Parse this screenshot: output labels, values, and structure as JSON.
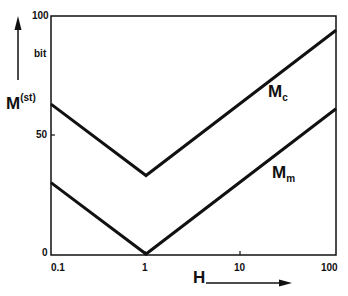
{
  "chart_data": {
    "type": "line",
    "title": "",
    "xlabel": "H",
    "ylabel": "M(st)",
    "ylabel_main": "M",
    "ylabel_sup": "(st)",
    "y_unit": "bit",
    "xscale": "log",
    "x_ticks": [
      "0.1",
      "1",
      "10",
      "100"
    ],
    "y_ticks": [
      "0",
      "50",
      "100"
    ],
    "xlim": [
      0.1,
      100
    ],
    "ylim": [
      0,
      100
    ],
    "grid": false,
    "legend": "inline labels",
    "x": [
      0.1,
      1,
      100
    ],
    "series": [
      {
        "name": "Mc",
        "label_main": "M",
        "label_sub": "c",
        "values": [
          63,
          33,
          94
        ]
      },
      {
        "name": "Mm",
        "label_main": "M",
        "label_sub": "m",
        "values": [
          30,
          0,
          61
        ]
      }
    ]
  }
}
